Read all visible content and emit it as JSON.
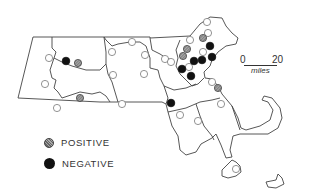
{
  "legend": {
    "items": [
      {
        "key": "positive",
        "label": "POSITIVE"
      },
      {
        "key": "negative",
        "label": "NEGATIVE"
      }
    ]
  },
  "scale": {
    "start": "0",
    "end": "20",
    "unit": "miles"
  },
  "colors": {
    "outline": "#444444",
    "negative": "#111111",
    "positive": "#8a8a8a",
    "open": "#ffffff"
  },
  "sites": {
    "positive": [
      [
        78,
        63
      ],
      [
        80,
        98
      ],
      [
        203,
        38
      ],
      [
        187,
        49
      ],
      [
        183,
        56
      ],
      [
        218,
        88
      ]
    ],
    "negative": [
      [
        66,
        61
      ],
      [
        210,
        46
      ],
      [
        194,
        61
      ],
      [
        202,
        60
      ],
      [
        212,
        57
      ],
      [
        182,
        69
      ],
      [
        191,
        76
      ],
      [
        171,
        103
      ]
    ],
    "open": [
      [
        49,
        58
      ],
      [
        45,
        84
      ],
      [
        57,
        108
      ],
      [
        112,
        52
      ],
      [
        132,
        42
      ],
      [
        145,
        55
      ],
      [
        113,
        75
      ],
      [
        144,
        74
      ],
      [
        122,
        104
      ],
      [
        165,
        59
      ],
      [
        171,
        62
      ],
      [
        190,
        40
      ],
      [
        207,
        22
      ],
      [
        208,
        33
      ],
      [
        203,
        52
      ],
      [
        189,
        67
      ],
      [
        212,
        82
      ],
      [
        180,
        115
      ],
      [
        221,
        104
      ],
      [
        198,
        121
      ],
      [
        236,
        169
      ]
    ]
  }
}
